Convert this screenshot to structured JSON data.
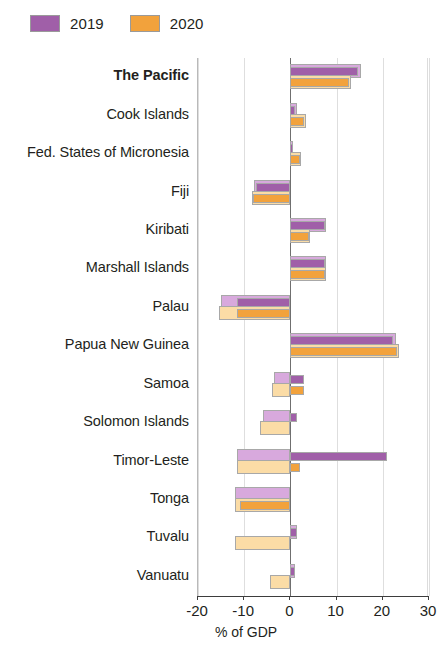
{
  "legend": {
    "entries": [
      {
        "label": "2019",
        "color": "#a05fa8"
      },
      {
        "label": "2020",
        "color": "#f2a23c"
      }
    ]
  },
  "axis": {
    "xlabel": "% of GDP",
    "ticks": [
      "-20",
      "-10",
      "0",
      "10",
      "20",
      "30"
    ]
  },
  "chart_data": {
    "type": "bar",
    "orientation": "horizontal",
    "title": "",
    "xlabel": "% of GDP",
    "ylabel": "",
    "xlim": [
      -20,
      30
    ],
    "xticks": [
      -20,
      -10,
      0,
      10,
      20,
      30
    ],
    "grid": true,
    "legend_position": "top-left",
    "note": "Each year has two overlapping bars: a lighter 'back' bar and a darker 'front' bar.",
    "categories": [
      "The Pacific",
      "Cook Islands",
      "Fed. States of Micronesia",
      "Fiji",
      "Kiribati",
      "Marshall Islands",
      "Palau",
      "Papua New Guinea",
      "Samoa",
      "Solomon Islands",
      "Timor-Leste",
      "Tonga",
      "Tuvalu",
      "Vanuatu"
    ],
    "series": [
      {
        "name": "2019",
        "color": "#a05fa8",
        "light_color": "#d8a9dd",
        "values": [
          14.7,
          1.0,
          0.5,
          -7.5,
          7.5,
          7.5,
          -11.5,
          22.3,
          3.0,
          1.5,
          21.0,
          0.0,
          1.5,
          1.0
        ],
        "back_values": [
          15.2,
          1.5,
          0.6,
          -7.8,
          7.8,
          7.8,
          -15.0,
          22.8,
          -3.5,
          -6.0,
          -11.5,
          -12.0,
          1.5,
          1.0
        ]
      },
      {
        "name": "2020",
        "color": "#f2a23c",
        "light_color": "#fbdca6",
        "values": [
          12.7,
          3.0,
          2.0,
          -8.0,
          4.0,
          7.5,
          -11.5,
          23.0,
          3.0,
          0.0,
          2.0,
          -11.0,
          0.0,
          0.0
        ],
        "back_values": [
          13.2,
          3.4,
          2.3,
          -8.3,
          4.3,
          7.8,
          -15.5,
          23.5,
          -4.0,
          -6.5,
          -11.5,
          -12.0,
          -12.0,
          -4.5
        ]
      }
    ]
  }
}
